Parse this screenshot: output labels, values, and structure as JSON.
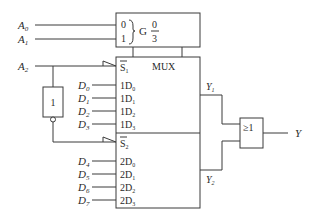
{
  "inputs": {
    "address": [
      {
        "name": "A",
        "sub": "0",
        "y": 25
      },
      {
        "name": "A",
        "sub": "1",
        "y": 39
      },
      {
        "name": "A",
        "sub": "2",
        "y": 66
      }
    ],
    "data": [
      {
        "name": "D",
        "sub": "0",
        "y": 85
      },
      {
        "name": "D",
        "sub": "1",
        "y": 98
      },
      {
        "name": "D",
        "sub": "2",
        "y": 111
      },
      {
        "name": "D",
        "sub": "3",
        "y": 124
      },
      {
        "name": "D",
        "sub": "4",
        "y": 161
      },
      {
        "name": "D",
        "sub": "5",
        "y": 174
      },
      {
        "name": "D",
        "sub": "6",
        "y": 187
      },
      {
        "name": "D",
        "sub": "7",
        "y": 200
      }
    ]
  },
  "control_block": {
    "pin0": "0",
    "pin1": "1",
    "G": "G",
    "frac_num": "0",
    "frac_den": "3"
  },
  "mux": {
    "title": "MUX",
    "s1": {
      "pre": "S",
      "sub": "1"
    },
    "s2": {
      "pre": "S",
      "sub": "2"
    },
    "upper_pins": [
      {
        "pre": "1D",
        "sub": "0"
      },
      {
        "pre": "1D",
        "sub": "1"
      },
      {
        "pre": "1D",
        "sub": "2"
      },
      {
        "pre": "1D",
        "sub": "3"
      }
    ],
    "lower_pins": [
      {
        "pre": "2D",
        "sub": "0"
      },
      {
        "pre": "2D",
        "sub": "1"
      },
      {
        "pre": "2D",
        "sub": "2"
      },
      {
        "pre": "2D",
        "sub": "3"
      }
    ]
  },
  "inverter": {
    "label": "1"
  },
  "outputs": {
    "y1": {
      "name": "Y",
      "sub": "1"
    },
    "y2": {
      "name": "Y",
      "sub": "2"
    },
    "or_gate": "≥1",
    "y": "Y"
  }
}
